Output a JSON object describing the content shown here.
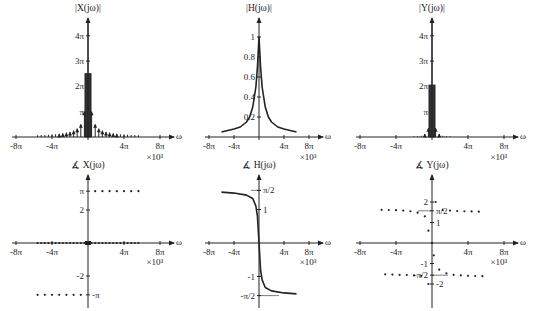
{
  "figure": {
    "layout": "2x3 grid of frequency-domain plots",
    "omega_scale_label": "×10³",
    "omega_axis_label": "ω",
    "x_tick_labels": [
      "-8π",
      "-4π",
      "4π",
      "8π"
    ]
  },
  "chart_data": [
    {
      "id": "mag_X",
      "type": "stem",
      "title": "|X(jω)|",
      "xlabel": "ω",
      "x_scale": "×10³",
      "xticks": [
        "-8π",
        "-4π",
        "4π",
        "8π"
      ],
      "yticks": [
        "π",
        "2π",
        "3π",
        "4π"
      ],
      "ylim": [
        0,
        4.4
      ],
      "ylim_units": "π",
      "x_units": "π×10³",
      "impulse_spacing": 0.4,
      "impulses": [
        {
          "x": -5.6,
          "y": 0.07
        },
        {
          "x": -5.2,
          "y": 0.08
        },
        {
          "x": -4.8,
          "y": 0.08
        },
        {
          "x": -4.4,
          "y": 0.09
        },
        {
          "x": -4.0,
          "y": 0.1
        },
        {
          "x": -3.6,
          "y": 0.11
        },
        {
          "x": -3.2,
          "y": 0.12
        },
        {
          "x": -2.8,
          "y": 0.14
        },
        {
          "x": -2.4,
          "y": 0.17
        },
        {
          "x": -2.0,
          "y": 0.2
        },
        {
          "x": -1.6,
          "y": 0.25
        },
        {
          "x": -1.2,
          "y": 0.33
        },
        {
          "x": -0.8,
          "y": 0.5
        },
        {
          "x": -0.4,
          "y": 1.0
        },
        {
          "x": 0,
          "y": 2.5
        },
        {
          "x": 0.4,
          "y": 1.0
        },
        {
          "x": 0.8,
          "y": 0.5
        },
        {
          "x": 1.2,
          "y": 0.33
        },
        {
          "x": 1.6,
          "y": 0.25
        },
        {
          "x": 2.0,
          "y": 0.2
        },
        {
          "x": 2.4,
          "y": 0.17
        },
        {
          "x": 2.8,
          "y": 0.14
        },
        {
          "x": 3.2,
          "y": 0.12
        },
        {
          "x": 3.6,
          "y": 0.11
        },
        {
          "x": 4.0,
          "y": 0.1
        },
        {
          "x": 4.4,
          "y": 0.09
        },
        {
          "x": 4.8,
          "y": 0.08
        },
        {
          "x": 5.2,
          "y": 0.08
        },
        {
          "x": 5.6,
          "y": 0.07
        }
      ]
    },
    {
      "id": "mag_H",
      "type": "line",
      "title": "|H(jω)|",
      "xlabel": "ω",
      "x_scale": "×10³",
      "xticks": [
        "-8π",
        "-4π",
        "4π",
        "8π"
      ],
      "yticks": [
        "0.2",
        "0.4",
        "0.6",
        "0.8",
        "1"
      ],
      "ylim": [
        0,
        1.15
      ],
      "x_units": "π×10³",
      "x": [
        -6,
        -4,
        -3,
        -2,
        -1.5,
        -1,
        -0.5,
        -0.25,
        0,
        0.25,
        0.5,
        1,
        1.5,
        2,
        3,
        4,
        6
      ],
      "y": [
        0.05,
        0.08,
        0.1,
        0.15,
        0.2,
        0.3,
        0.5,
        0.7,
        1.0,
        0.7,
        0.5,
        0.3,
        0.2,
        0.15,
        0.1,
        0.08,
        0.05
      ]
    },
    {
      "id": "mag_Y",
      "type": "stem",
      "title": "|Y(jω)|",
      "xlabel": "ω",
      "x_scale": "×10³",
      "xticks": [
        "-8π",
        "-4π",
        "4π",
        "8π"
      ],
      "yticks": [
        "π",
        "2π",
        "3π",
        "4π"
      ],
      "ylim": [
        0,
        4.4
      ],
      "ylim_units": "π",
      "x_units": "π×10³",
      "impulses": [
        {
          "x": -2.0,
          "y": 0.02
        },
        {
          "x": -1.6,
          "y": 0.03
        },
        {
          "x": -1.2,
          "y": 0.05
        },
        {
          "x": -0.8,
          "y": 0.12
        },
        {
          "x": -0.4,
          "y": 0.35
        },
        {
          "x": 0,
          "y": 2.05
        },
        {
          "x": 0.4,
          "y": 0.35
        },
        {
          "x": 0.8,
          "y": 0.12
        },
        {
          "x": 1.2,
          "y": 0.05
        },
        {
          "x": 1.6,
          "y": 0.03
        },
        {
          "x": 2.0,
          "y": 0.02
        }
      ]
    },
    {
      "id": "phase_X",
      "type": "scatter",
      "title": "∡ X(jω)",
      "xlabel": "ω",
      "x_scale": "×10³",
      "xticks": [
        "-8π",
        "-4π",
        "4π",
        "8π"
      ],
      "yticks": [
        "π",
        "2",
        "-2",
        "-π"
      ],
      "ylim": [
        -3.4,
        3.4
      ],
      "x_units": "π×10³",
      "points_upper": {
        "x_from": 0.8,
        "x_to": 5.6,
        "step": 0.8,
        "y": 3.1416
      },
      "points_lower": {
        "x_from": -5.6,
        "x_to": -0.8,
        "step": 0.8,
        "y": -3.1416
      },
      "points_zero": {
        "x_from": -5.6,
        "x_to": 5.6,
        "step": 0.4,
        "y": 0
      }
    },
    {
      "id": "phase_H",
      "type": "line",
      "title": "∡ H(jω)",
      "xlabel": "ω",
      "x_scale": "×10³",
      "xticks": [
        "-8π",
        "-4π",
        "4π",
        "8π"
      ],
      "yticks": [
        "π/2",
        "1",
        "-1",
        "-π/2"
      ],
      "ylim": [
        -2.0,
        2.0
      ],
      "x_units": "π×10³",
      "x": [
        -6,
        -4,
        -2,
        -1,
        -0.5,
        -0.25,
        0,
        0.25,
        0.5,
        1,
        2,
        4,
        6
      ],
      "y": [
        1.52,
        1.49,
        1.43,
        1.33,
        1.1,
        0.8,
        0,
        -0.8,
        -1.1,
        -1.33,
        -1.43,
        -1.49,
        -1.52
      ]
    },
    {
      "id": "phase_Y",
      "type": "scatter",
      "title": "∡ Y(jω)",
      "xlabel": "ω",
      "x_scale": "×10³",
      "xticks": [
        "-8π",
        "-4π",
        "4π",
        "8π"
      ],
      "yticks": [
        "2",
        "π/2",
        "1",
        "-1",
        "-π/2",
        "-2"
      ],
      "ylim": [
        -2.8,
        2.8
      ],
      "x_units": "π×10³",
      "points": [
        {
          "x": -5.6,
          "y": 1.62
        },
        {
          "x": -4.8,
          "y": 1.61
        },
        {
          "x": -4.0,
          "y": 1.6
        },
        {
          "x": -3.2,
          "y": 1.58
        },
        {
          "x": -2.4,
          "y": 1.55
        },
        {
          "x": -1.6,
          "y": 1.48
        },
        {
          "x": -0.8,
          "y": 1.3
        },
        {
          "x": -0.4,
          "y": 0.6
        },
        {
          "x": 0,
          "y": 0
        },
        {
          "x": 0.4,
          "y": 2.0
        },
        {
          "x": 1.2,
          "y": 1.6
        },
        {
          "x": 2.0,
          "y": 1.58
        },
        {
          "x": 2.8,
          "y": 1.56
        },
        {
          "x": 3.6,
          "y": 1.55
        },
        {
          "x": 4.4,
          "y": 1.54
        },
        {
          "x": 5.2,
          "y": 1.53
        },
        {
          "x": 0.2,
          "y": -0.6
        },
        {
          "x": 0.8,
          "y": -1.3
        },
        {
          "x": 1.6,
          "y": -1.48
        },
        {
          "x": 2.4,
          "y": -1.55
        },
        {
          "x": 3.2,
          "y": -1.58
        },
        {
          "x": 4.0,
          "y": -1.6
        },
        {
          "x": 4.8,
          "y": -1.61
        },
        {
          "x": 5.6,
          "y": -1.62
        },
        {
          "x": -0.4,
          "y": -2.0
        },
        {
          "x": -1.2,
          "y": -1.6
        },
        {
          "x": -2.0,
          "y": -1.58
        },
        {
          "x": -2.8,
          "y": -1.56
        },
        {
          "x": -3.6,
          "y": -1.55
        },
        {
          "x": -4.4,
          "y": -1.54
        },
        {
          "x": -5.2,
          "y": -1.53
        }
      ]
    }
  ],
  "panels": {
    "p1": {
      "title": "|X(jω)|",
      "yticks": [
        "4π",
        "3π",
        "2π",
        "π"
      ]
    },
    "p2": {
      "title": "|H(jω)|",
      "yticks": [
        "1",
        "0.8",
        "0.6",
        "0.4",
        "0.2"
      ]
    },
    "p3": {
      "title": "|Y(jω)|",
      "yticks": [
        "4π",
        "3π",
        "2π",
        "π"
      ]
    },
    "p4": {
      "title": "∡ X(jω)",
      "yticks": [
        "π",
        "2",
        "-2",
        "-π"
      ]
    },
    "p5": {
      "title": "∡ H(jω)",
      "yticks": [
        "π/2",
        "1",
        "-1",
        "-π/2"
      ]
    },
    "p6": {
      "title": "∡ Y(jω)",
      "yticks": [
        "2",
        "π/2",
        "1",
        "-1",
        "-π/2",
        "-2"
      ]
    }
  }
}
